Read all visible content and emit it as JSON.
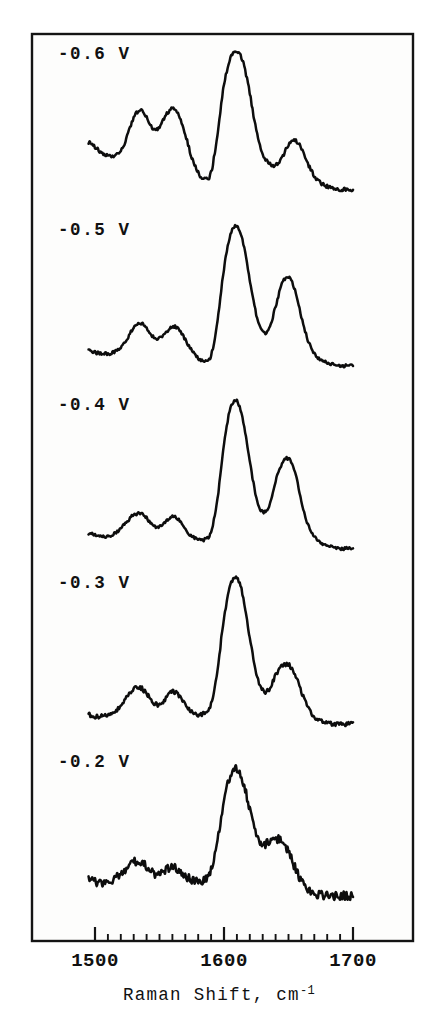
{
  "figure": {
    "background_color": "#ffffff",
    "plot_background_color": "#fdfdfc",
    "line_color": "#0d0d0d",
    "frame_color": "#141414"
  },
  "axis": {
    "xlabel_main": "Raman Shift,",
    "xlabel_unit_base": "cm",
    "xlabel_unit_exp": "-1",
    "xlabel_full": "Raman Shift, cm-1",
    "tick_labels": [
      "1500",
      "1600",
      "1700"
    ],
    "tick_values": [
      1500,
      1600,
      1700
    ],
    "minor_tick_step": 10,
    "xlim": [
      1480,
      1712
    ]
  },
  "chart_data": {
    "type": "line",
    "title": "",
    "subtitle": "",
    "xlabel": "Raman Shift, cm-1",
    "ylabel": "",
    "xlim": [
      1480,
      1712
    ],
    "grid": false,
    "legend_position": "inline-above-each-trace",
    "annotations": [
      "-0.6 V",
      "-0.5 V",
      "-0.4 V",
      "-0.3 V",
      "-0.2 V"
    ],
    "x_tick_labels": [
      "1500",
      "1600",
      "1700"
    ],
    "series": [
      {
        "name": "-0.6 V",
        "label": "-0.6 V",
        "noise": 0.012,
        "x": [
          1495,
          1500,
          1505,
          1510,
          1515,
          1520,
          1525,
          1530,
          1535,
          1540,
          1545,
          1550,
          1555,
          1560,
          1565,
          1570,
          1575,
          1580,
          1585,
          1590,
          1595,
          1600,
          1605,
          1610,
          1615,
          1620,
          1625,
          1630,
          1635,
          1640,
          1645,
          1650,
          1655,
          1660,
          1665,
          1670,
          1675,
          1680,
          1685,
          1690,
          1695,
          1700
        ],
        "y": [
          0.4,
          0.37,
          0.33,
          0.31,
          0.31,
          0.34,
          0.44,
          0.56,
          0.61,
          0.56,
          0.49,
          0.5,
          0.58,
          0.62,
          0.58,
          0.45,
          0.3,
          0.2,
          0.16,
          0.2,
          0.46,
          0.78,
          0.95,
          1.0,
          0.92,
          0.72,
          0.48,
          0.32,
          0.26,
          0.25,
          0.3,
          0.38,
          0.41,
          0.36,
          0.26,
          0.18,
          0.13,
          0.11,
          0.1,
          0.09,
          0.09,
          0.09
        ]
      },
      {
        "name": "-0.5 V",
        "label": "-0.5 V",
        "noise": 0.01,
        "x": [
          1495,
          1500,
          1505,
          1510,
          1515,
          1520,
          1525,
          1530,
          1535,
          1540,
          1545,
          1550,
          1555,
          1560,
          1565,
          1570,
          1575,
          1580,
          1585,
          1590,
          1595,
          1600,
          1605,
          1610,
          1615,
          1620,
          1625,
          1630,
          1635,
          1640,
          1645,
          1650,
          1655,
          1660,
          1665,
          1670,
          1675,
          1680,
          1685,
          1690,
          1695,
          1700
        ],
        "y": [
          0.18,
          0.17,
          0.16,
          0.16,
          0.17,
          0.2,
          0.26,
          0.33,
          0.36,
          0.33,
          0.27,
          0.26,
          0.3,
          0.34,
          0.32,
          0.25,
          0.18,
          0.13,
          0.11,
          0.15,
          0.38,
          0.72,
          0.94,
          1.0,
          0.88,
          0.64,
          0.42,
          0.3,
          0.32,
          0.47,
          0.62,
          0.66,
          0.58,
          0.4,
          0.25,
          0.16,
          0.12,
          0.1,
          0.09,
          0.08,
          0.08,
          0.08
        ]
      },
      {
        "name": "-0.4 V",
        "label": "-0.4 V",
        "noise": 0.01,
        "x": [
          1495,
          1500,
          1505,
          1510,
          1515,
          1520,
          1525,
          1530,
          1535,
          1540,
          1545,
          1550,
          1555,
          1560,
          1565,
          1570,
          1575,
          1580,
          1585,
          1590,
          1595,
          1600,
          1605,
          1610,
          1615,
          1620,
          1625,
          1630,
          1635,
          1640,
          1645,
          1650,
          1655,
          1660,
          1665,
          1670,
          1675,
          1680,
          1685,
          1690,
          1695,
          1700
        ],
        "y": [
          0.13,
          0.12,
          0.11,
          0.11,
          0.13,
          0.16,
          0.21,
          0.25,
          0.26,
          0.23,
          0.18,
          0.17,
          0.21,
          0.24,
          0.22,
          0.16,
          0.11,
          0.09,
          0.09,
          0.14,
          0.36,
          0.72,
          0.95,
          1.0,
          0.86,
          0.6,
          0.37,
          0.27,
          0.31,
          0.47,
          0.59,
          0.62,
          0.53,
          0.34,
          0.19,
          0.11,
          0.07,
          0.05,
          0.04,
          0.03,
          0.03,
          0.03
        ]
      },
      {
        "name": "-0.3 V",
        "label": "-0.3 V",
        "noise": 0.014,
        "x": [
          1495,
          1500,
          1505,
          1510,
          1515,
          1520,
          1525,
          1530,
          1535,
          1540,
          1545,
          1550,
          1555,
          1560,
          1565,
          1570,
          1575,
          1580,
          1585,
          1590,
          1595,
          1600,
          1605,
          1610,
          1615,
          1620,
          1625,
          1630,
          1635,
          1640,
          1645,
          1650,
          1655,
          1660,
          1665,
          1670,
          1675,
          1680,
          1685,
          1690,
          1695,
          1700
        ],
        "y": [
          0.1,
          0.09,
          0.09,
          0.1,
          0.12,
          0.16,
          0.22,
          0.27,
          0.28,
          0.24,
          0.18,
          0.17,
          0.21,
          0.25,
          0.23,
          0.17,
          0.12,
          0.1,
          0.11,
          0.17,
          0.4,
          0.74,
          0.95,
          1.0,
          0.87,
          0.61,
          0.37,
          0.26,
          0.27,
          0.36,
          0.42,
          0.43,
          0.37,
          0.25,
          0.15,
          0.09,
          0.06,
          0.05,
          0.04,
          0.04,
          0.04,
          0.04
        ]
      },
      {
        "name": "-0.2 V",
        "label": "-0.2 V",
        "noise": 0.03,
        "x": [
          1495,
          1500,
          1505,
          1510,
          1515,
          1520,
          1525,
          1530,
          1535,
          1540,
          1545,
          1550,
          1555,
          1560,
          1565,
          1570,
          1575,
          1580,
          1585,
          1590,
          1595,
          1600,
          1605,
          1610,
          1615,
          1620,
          1625,
          1630,
          1635,
          1640,
          1645,
          1650,
          1655,
          1660,
          1665,
          1670,
          1675,
          1680,
          1685,
          1690,
          1695,
          1700
        ],
        "y": [
          0.22,
          0.2,
          0.19,
          0.2,
          0.22,
          0.25,
          0.3,
          0.34,
          0.35,
          0.31,
          0.26,
          0.25,
          0.28,
          0.3,
          0.28,
          0.24,
          0.21,
          0.2,
          0.22,
          0.28,
          0.48,
          0.78,
          0.94,
          1.0,
          0.9,
          0.7,
          0.52,
          0.46,
          0.48,
          0.5,
          0.48,
          0.41,
          0.3,
          0.21,
          0.15,
          0.12,
          0.11,
          0.1,
          0.1,
          0.1,
          0.1,
          0.1
        ]
      }
    ]
  }
}
